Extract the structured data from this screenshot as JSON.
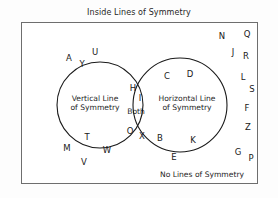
{
  "diagram": {
    "type": "venn-2-set",
    "title": "Inside Lines of Symmetry",
    "outside_caption": "No Lines of Symmetry",
    "colors": {
      "box_border": "#6e6e6e",
      "circle_stroke": "#1a1a1a",
      "text": "#1f1f1f",
      "background": "#ffffff"
    },
    "sets": {
      "left": {
        "label_line1": "Vertical Line",
        "label_line2": "of Symmetry",
        "members": [
          "A",
          "U",
          "Y",
          "M",
          "T",
          "W",
          "V"
        ]
      },
      "right": {
        "label_line1": "Horizontal Line",
        "label_line2": "of Symmetry",
        "members": [
          "C",
          "D",
          "B",
          "K",
          "E"
        ]
      },
      "intersection": {
        "label": "Both",
        "members": [
          "H",
          "I",
          "O",
          "X"
        ]
      },
      "outside": {
        "members": [
          "N",
          "Q",
          "J",
          "R",
          "L",
          "S",
          "F",
          "Z",
          "G",
          "P"
        ]
      }
    },
    "letters": [
      {
        "char": "A",
        "region": "left",
        "x": 69,
        "y": 58
      },
      {
        "char": "U",
        "region": "left",
        "x": 95,
        "y": 52
      },
      {
        "char": "Y",
        "region": "left",
        "x": 82,
        "y": 64
      },
      {
        "char": "T",
        "region": "left",
        "x": 87,
        "y": 137
      },
      {
        "char": "M",
        "region": "left",
        "x": 67,
        "y": 148
      },
      {
        "char": "W",
        "region": "left",
        "x": 107,
        "y": 150
      },
      {
        "char": "V",
        "region": "left",
        "x": 84,
        "y": 162
      },
      {
        "char": "H",
        "region": "intersection",
        "x": 133,
        "y": 88
      },
      {
        "char": "I",
        "region": "intersection",
        "x": 140,
        "y": 98
      },
      {
        "char": "O",
        "region": "intersection",
        "x": 130,
        "y": 131
      },
      {
        "char": "X",
        "region": "intersection",
        "x": 142,
        "y": 136
      },
      {
        "char": "C",
        "region": "right",
        "x": 167,
        "y": 76
      },
      {
        "char": "D",
        "region": "right",
        "x": 190,
        "y": 74
      },
      {
        "char": "B",
        "region": "right",
        "x": 160,
        "y": 138
      },
      {
        "char": "K",
        "region": "right",
        "x": 193,
        "y": 140
      },
      {
        "char": "E",
        "region": "right",
        "x": 174,
        "y": 157
      },
      {
        "char": "N",
        "region": "outside",
        "x": 222,
        "y": 36
      },
      {
        "char": "Q",
        "region": "outside",
        "x": 247,
        "y": 34
      },
      {
        "char": "J",
        "region": "outside",
        "x": 233,
        "y": 52
      },
      {
        "char": "R",
        "region": "outside",
        "x": 246,
        "y": 56
      },
      {
        "char": "L",
        "region": "outside",
        "x": 243,
        "y": 77
      },
      {
        "char": "S",
        "region": "outside",
        "x": 252,
        "y": 89
      },
      {
        "char": "F",
        "region": "outside",
        "x": 247,
        "y": 108
      },
      {
        "char": "Z",
        "region": "outside",
        "x": 248,
        "y": 127
      },
      {
        "char": "G",
        "region": "outside",
        "x": 238,
        "y": 152
      },
      {
        "char": "P",
        "region": "outside",
        "x": 251,
        "y": 158
      }
    ],
    "geometry": {
      "box": {
        "x": 21,
        "y": 22,
        "w": 237,
        "h": 162
      },
      "left_circle": {
        "cx": 100,
        "cy": 105,
        "r": 43
      },
      "right_circle": {
        "cx": 180,
        "cy": 105,
        "r": 47
      }
    }
  }
}
